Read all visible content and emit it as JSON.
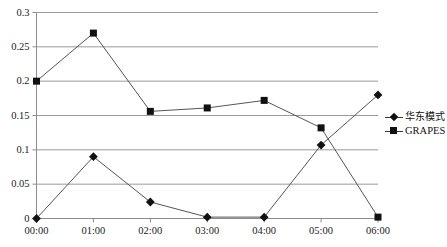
{
  "chart_data": {
    "type": "line",
    "title": "",
    "subtitle": "",
    "xlabel": "",
    "ylabel": "",
    "categories": [
      "00:00",
      "01:00",
      "02:00",
      "03:00",
      "04:00",
      "05:00",
      "06:00"
    ],
    "x": [
      "00:00",
      "01:00",
      "02:00",
      "03:00",
      "04:00",
      "05:00",
      "06:00"
    ],
    "series": [
      {
        "name": "华东模式",
        "marker": "diamond",
        "color": "#111111",
        "values": [
          0.0,
          0.09,
          0.024,
          0.002,
          0.002,
          0.107,
          0.18
        ]
      },
      {
        "name": "GRAPES",
        "marker": "square",
        "color": "#111111",
        "values": [
          0.2,
          0.27,
          0.156,
          0.161,
          0.172,
          0.132,
          0.002
        ]
      }
    ],
    "ylim": [
      0,
      0.3
    ],
    "yticks": [
      0,
      0.05,
      0.1,
      0.15,
      0.2,
      0.25,
      0.3
    ],
    "ytick_labels": [
      "0",
      "0.05",
      "0.1",
      "0.15",
      "0.2",
      "0.25",
      "0.3"
    ],
    "xtick_labels": [
      "00:00",
      "01:00",
      "02:00",
      "03:00",
      "04:00",
      "05:00",
      "06:00"
    ],
    "grid": true,
    "grid_axis": "y",
    "legend": true,
    "legend_position": "right",
    "legend_entries": [
      "华东模式",
      "GRAPES"
    ],
    "line_color": "#555555",
    "grid_color": "#9a9a9a",
    "axis_color": "#8c8c8c"
  },
  "legend": {
    "items": [
      {
        "label": "华东模式",
        "marker": "diamond-marker-icon"
      },
      {
        "label": "GRAPES",
        "marker": "square-marker-icon"
      }
    ]
  },
  "axes": {
    "y": {
      "ticks": [
        {
          "label": "0.3"
        },
        {
          "label": "0.25"
        },
        {
          "label": "0.2"
        },
        {
          "label": "0.15"
        },
        {
          "label": "0.1"
        },
        {
          "label": "0.05"
        },
        {
          "label": "0"
        }
      ]
    },
    "x": {
      "ticks": [
        {
          "label": "00:00"
        },
        {
          "label": "01:00"
        },
        {
          "label": "02:00"
        },
        {
          "label": "03:00"
        },
        {
          "label": "04:00"
        },
        {
          "label": "05:00"
        },
        {
          "label": "06:00"
        }
      ]
    }
  }
}
